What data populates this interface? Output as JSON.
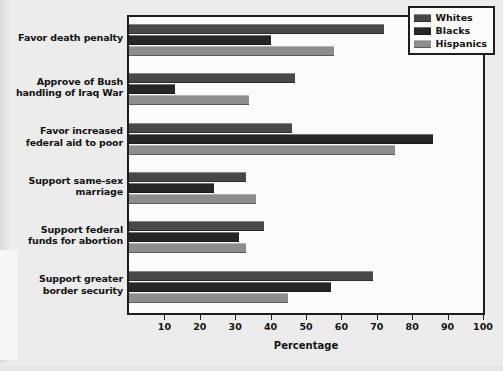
{
  "chart_data": {
    "type": "bar",
    "orientation": "horizontal",
    "title": "",
    "xlabel": "Percentage",
    "ylabel": "",
    "xlim": [
      0,
      100
    ],
    "xticks": [
      10,
      20,
      30,
      40,
      50,
      60,
      70,
      80,
      90,
      100
    ],
    "grid": false,
    "legend_position": "top-right",
    "categories": [
      "Favor death penalty",
      "Approve of Bush handling of Iraq War",
      "Favor increased federal aid to poor",
      "Support same-sex marriage",
      "Support federal funds for abortion",
      "Support greater border security"
    ],
    "category_lines": [
      [
        "Favor death penalty"
      ],
      [
        "Approve of Bush",
        "handling of Iraq War"
      ],
      [
        "Favor increased",
        "federal aid to poor"
      ],
      [
        "Support same-sex",
        "marriage"
      ],
      [
        "Support federal",
        "funds for abortion"
      ],
      [
        "Support greater",
        "border security"
      ]
    ],
    "series": [
      {
        "name": "Whites",
        "color": "#484848",
        "values": [
          72,
          47,
          46,
          33,
          38,
          69
        ]
      },
      {
        "name": "Blacks",
        "color": "#262626",
        "values": [
          40,
          13,
          86,
          24,
          31,
          57
        ]
      },
      {
        "name": "Hispanics",
        "color": "#8d8d8d",
        "values": [
          58,
          34,
          75,
          36,
          33,
          45
        ]
      }
    ]
  },
  "legend": {
    "items": [
      {
        "label": "Whites"
      },
      {
        "label": "Blacks"
      },
      {
        "label": "Hispanics"
      }
    ]
  },
  "axis": {
    "title": "Percentage"
  }
}
